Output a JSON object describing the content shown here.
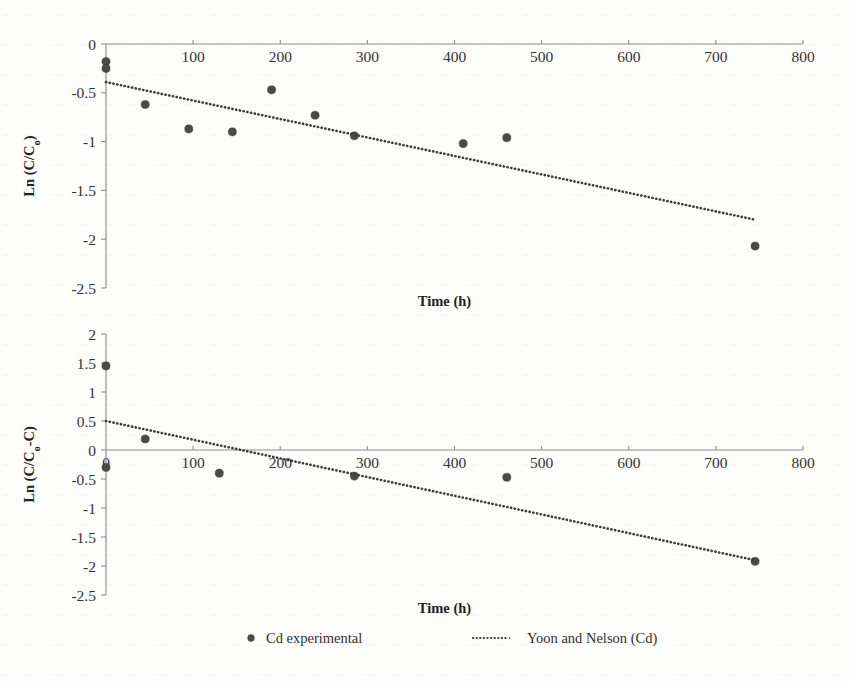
{
  "figure": {
    "background_color": "#fdfdfc",
    "marker_color": "#4a4a4a",
    "line_color": "#3a3a3a",
    "axis_color": "#8e8e8e"
  },
  "legend": {
    "position": "bottom-center",
    "entries": [
      {
        "label": "Cd experimental",
        "marker": "circle",
        "color": "#4a4a4a"
      },
      {
        "label": "Yoon and Nelson (Cd)",
        "marker": "dotted-line",
        "color": "#3a3a3a"
      }
    ]
  },
  "chart_data": [
    {
      "id": "top",
      "type": "scatter",
      "title": "",
      "xlabel": "Time (h)",
      "ylabel": "Ln (C/C₀)",
      "ylabel_parts": {
        "pre": "Ln (C/C",
        "sub": "o",
        "post": ")"
      },
      "xlim": [
        0,
        800
      ],
      "ylim": [
        -2.5,
        0
      ],
      "xticks": [
        0,
        100,
        200,
        300,
        400,
        500,
        600,
        700,
        800
      ],
      "xticklabels": [
        "0",
        "100",
        "200",
        "300",
        "400",
        "500",
        "600",
        "700",
        "800"
      ],
      "yticks": [
        0,
        -0.5,
        -1,
        -1.5,
        -2,
        -2.5
      ],
      "yticklabels": [
        "0",
        "-0.5",
        "-1",
        "-1.5",
        "-2",
        "-2.5"
      ],
      "grid": false,
      "xaxis_at_y": 0,
      "series": [
        {
          "name": "Cd experimental",
          "type": "scatter",
          "x": [
            0,
            0,
            45,
            95,
            145,
            190,
            240,
            285,
            410,
            460,
            745
          ],
          "y": [
            -0.18,
            -0.25,
            -0.62,
            -0.87,
            -0.9,
            -0.47,
            -0.73,
            -0.94,
            -1.02,
            -0.96,
            -2.07
          ]
        },
        {
          "name": "Yoon and Nelson (Cd)",
          "type": "line",
          "style": "dotted",
          "x": [
            0,
            745
          ],
          "y": [
            -0.39,
            -1.8
          ]
        }
      ]
    },
    {
      "id": "bottom",
      "type": "scatter",
      "title": "",
      "xlabel": "Time (h)",
      "ylabel": "Ln (C/C₀-C)",
      "ylabel_parts": {
        "pre": "Ln (C/C",
        "sub": "o",
        "post": "-C)"
      },
      "xlim": [
        0,
        800
      ],
      "ylim": [
        -2.5,
        2
      ],
      "xticks": [
        0,
        100,
        200,
        300,
        400,
        500,
        600,
        700,
        800
      ],
      "xticklabels": [
        "0",
        "100",
        "200",
        "300",
        "400",
        "500",
        "600",
        "700",
        "800"
      ],
      "yticks": [
        2,
        1.5,
        1,
        0.5,
        0,
        -0.5,
        -1,
        -1.5,
        -2,
        -2.5
      ],
      "yticklabels": [
        "2",
        "1.5",
        "1",
        "0.5",
        "0",
        "-0.5",
        "-1",
        "-1.5",
        "-2",
        "-2.5"
      ],
      "grid": false,
      "xaxis_at_y": 0,
      "series": [
        {
          "name": "Cd experimental",
          "type": "scatter",
          "x": [
            0,
            0,
            45,
            130,
            285,
            460,
            745
          ],
          "y": [
            1.45,
            -0.3,
            0.19,
            -0.4,
            -0.45,
            -0.47,
            -1.92
          ]
        },
        {
          "name": "Yoon and Nelson (Cd)",
          "type": "line",
          "style": "dotted",
          "x": [
            0,
            745
          ],
          "y": [
            0.5,
            -1.9
          ]
        }
      ]
    }
  ]
}
